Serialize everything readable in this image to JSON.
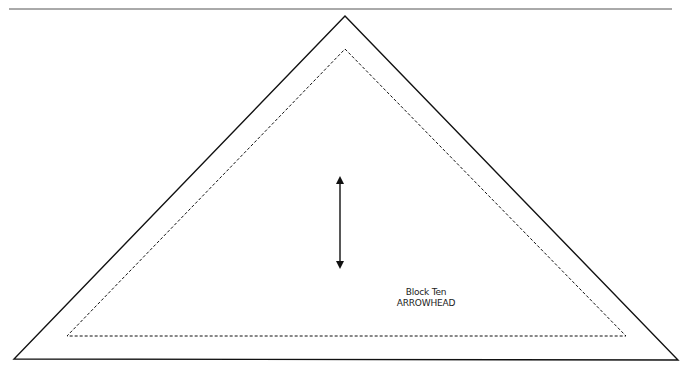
{
  "pattern": {
    "block_title": "Block Ten",
    "block_name": "ARROWHEAD"
  },
  "shapes": {
    "top_rule": {
      "x1": 9,
      "y1": 9,
      "x2": 672,
      "y2": 9
    },
    "outer_triangle": "345,16 678,360 14,359",
    "seam_triangle": "345,49 626,336 67,336",
    "grain_arrow": {
      "x": 340,
      "y1": 177,
      "y2": 268
    }
  },
  "colors": {
    "line": "#111111",
    "rule": "#555555"
  }
}
